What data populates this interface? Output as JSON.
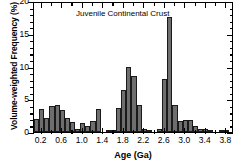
{
  "chart_data": {
    "type": "bar",
    "title": "Juvenile Continental Crust",
    "xlabel": "Age (Ga)",
    "ylabel": "Volume-weighted Frequency (%)",
    "xlim": [
      0.05,
      3.95
    ],
    "ylim": [
      0,
      20
    ],
    "xticks": [
      0.2,
      0.6,
      1.0,
      1.4,
      1.8,
      2.2,
      2.6,
      3.0,
      3.4,
      3.8
    ],
    "xtick_labels": [
      "0.2",
      "0.6",
      "1.0",
      "1.4",
      "1.8",
      "2.2",
      "2.6",
      "3.0",
      "3.4",
      "3.8"
    ],
    "xticks_minor": [
      0.4,
      0.8,
      1.2,
      1.6,
      2.0,
      2.4,
      2.8,
      3.2,
      3.6
    ],
    "yticks": [
      0,
      5,
      10,
      15,
      20
    ],
    "ytick_labels": [
      "0",
      "5",
      "10",
      "15",
      "20"
    ],
    "yticks_minor": [
      1,
      2,
      3,
      4,
      6,
      7,
      8,
      9,
      11,
      12,
      13,
      14,
      16,
      17,
      18,
      19
    ],
    "grid": false,
    "legend": null,
    "bin_width": 0.1,
    "bar_color": "#6e6e6e",
    "bar_edge_color": "#1a1a1a",
    "x": [
      0.1,
      0.2,
      0.3,
      0.4,
      0.5,
      0.6,
      0.7,
      0.8,
      0.9,
      1.0,
      1.1,
      1.2,
      1.3,
      1.4,
      1.5,
      1.6,
      1.7,
      1.8,
      1.9,
      2.0,
      2.1,
      2.2,
      2.3,
      2.4,
      2.5,
      2.6,
      2.7,
      2.8,
      2.9,
      3.0,
      3.1,
      3.2,
      3.3,
      3.4,
      3.5,
      3.6,
      3.7,
      3.8,
      3.9
    ],
    "values": [
      2.0,
      3.5,
      2.1,
      3.9,
      4.2,
      3.4,
      2.2,
      1.6,
      0.4,
      1.3,
      0.9,
      1.7,
      3.5,
      0.0,
      0.3,
      0.2,
      3.7,
      6.4,
      9.9,
      8.6,
      4.2,
      0.5,
      0.1,
      0.0,
      0.4,
      8.1,
      17.5,
      4.1,
      1.7,
      1.9,
      1.8,
      0.9,
      0.4,
      0.5,
      0.2,
      0.0,
      0.2,
      0.1,
      0.0
    ]
  }
}
